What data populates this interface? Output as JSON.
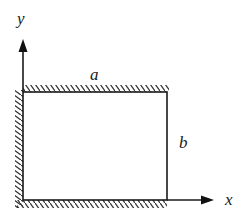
{
  "diagram": {
    "type": "rectangular plate with clamped edges and coordinate axes",
    "colors": {
      "line": "#1a1a1a",
      "hatch": "#333333",
      "background": "#ffffff"
    },
    "labels": {
      "y_axis": "y",
      "x_axis": "x",
      "width": "a",
      "height": "b"
    },
    "rectangle": {
      "left": 23,
      "top": 92,
      "right": 167,
      "bottom": 200
    },
    "clamped_edges": [
      "top",
      "left",
      "bottom"
    ],
    "free_edges": [
      "right"
    ],
    "axes": {
      "origin": [
        23,
        200
      ],
      "y_arrow_tip": [
        23,
        40
      ],
      "x_arrow_tip": [
        213,
        200
      ]
    }
  }
}
